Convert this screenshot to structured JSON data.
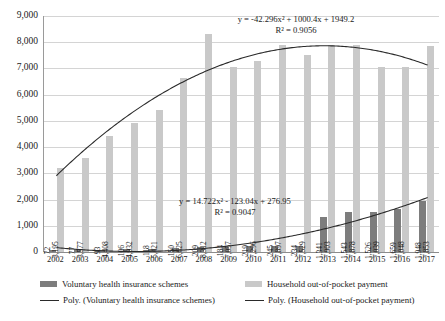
{
  "chart_data": {
    "type": "bar",
    "title": "",
    "xlabel": "",
    "ylabel": "",
    "ylim": [
      0,
      9000
    ],
    "grid": true,
    "legend_position": "bottom",
    "categories": [
      "2002",
      "2003",
      "2004",
      "2005",
      "2006",
      "2007",
      "2008",
      "2009",
      "2010",
      "2011",
      "2012",
      "2013",
      "2014",
      "2015",
      "2016",
      "2017"
    ],
    "series": [
      {
        "name": "Voluntary health insurance schemes",
        "type": "bar",
        "color": "#7d7d7d",
        "values": [
          72,
          77,
          93,
          106,
          118,
          150,
          209,
          184,
          219,
          245,
          234,
          1341,
          1543,
          1526,
          1659,
          1948
        ],
        "labels": [
          "72",
          "77",
          "93",
          "106",
          "118",
          "150",
          "209",
          "184",
          "219",
          "245",
          "234",
          "1,341",
          "1,543",
          "1,526",
          "1,659",
          "1,948"
        ]
      },
      {
        "name": "Household out-of-pocket payment",
        "type": "bar",
        "color": "#c9c9c9",
        "values": [
          3195,
          3577,
          4408,
          4932,
          5421,
          6625,
          8312,
          7057,
          7296,
          7897,
          7529,
          7903,
          7878,
          7039,
          7048,
          7853
        ],
        "labels": [
          "3,195",
          "3,577",
          "4,408",
          "4,932",
          "5,421",
          "6,625",
          "8,312",
          "7,057",
          "7,296",
          "7,897",
          "7,529",
          "7,903",
          "7,878",
          "7,039",
          "7,048",
          "7,853"
        ]
      },
      {
        "name": "Poly. (Voluntary health insurance schemes)",
        "type": "line",
        "color": "#2a2a2a",
        "coefficients": [
          14.722,
          -123.04,
          276.95
        ],
        "equation": "y = 14.722x² - 123.04x + 276.95",
        "r_squared": "R² = 0.9047"
      },
      {
        "name": "Poly. (Household out-of-pocket payment)",
        "type": "line",
        "color": "#2a2a2a",
        "coefficients": [
          -42.296,
          1000.4,
          1949.2
        ],
        "equation": "y = -42.296x² + 1000.4x + 1949.2",
        "r_squared": "R² = 0.9056"
      }
    ],
    "yticks": [
      "9,000",
      "8,000",
      "7,000",
      "6,000",
      "5,000",
      "4,000",
      "3,000",
      "2,000",
      "1,000",
      "0"
    ],
    "ytick_values": [
      9000,
      8000,
      7000,
      6000,
      5000,
      4000,
      3000,
      2000,
      1000,
      0
    ]
  },
  "annotations": {
    "household_equation": "y = -42.296x² + 1000.4x + 1949.2",
    "household_r2": "R² = 0.9056",
    "voluntary_equation": "y = 14.722x² - 123.04x + 276.95",
    "voluntary_r2": "R² = 0.9047"
  },
  "legend": {
    "items": [
      {
        "label": "Voluntary health insurance schemes",
        "marker": "bar-dark-swatch"
      },
      {
        "label": "Household out-of-pocket payment",
        "marker": "bar-light-swatch"
      },
      {
        "label": "Poly. (Voluntary health insurance schemes)",
        "marker": "line-swatch"
      },
      {
        "label": "Poly. (Household out-of-pocket payment)",
        "marker": "line-swatch"
      }
    ]
  }
}
